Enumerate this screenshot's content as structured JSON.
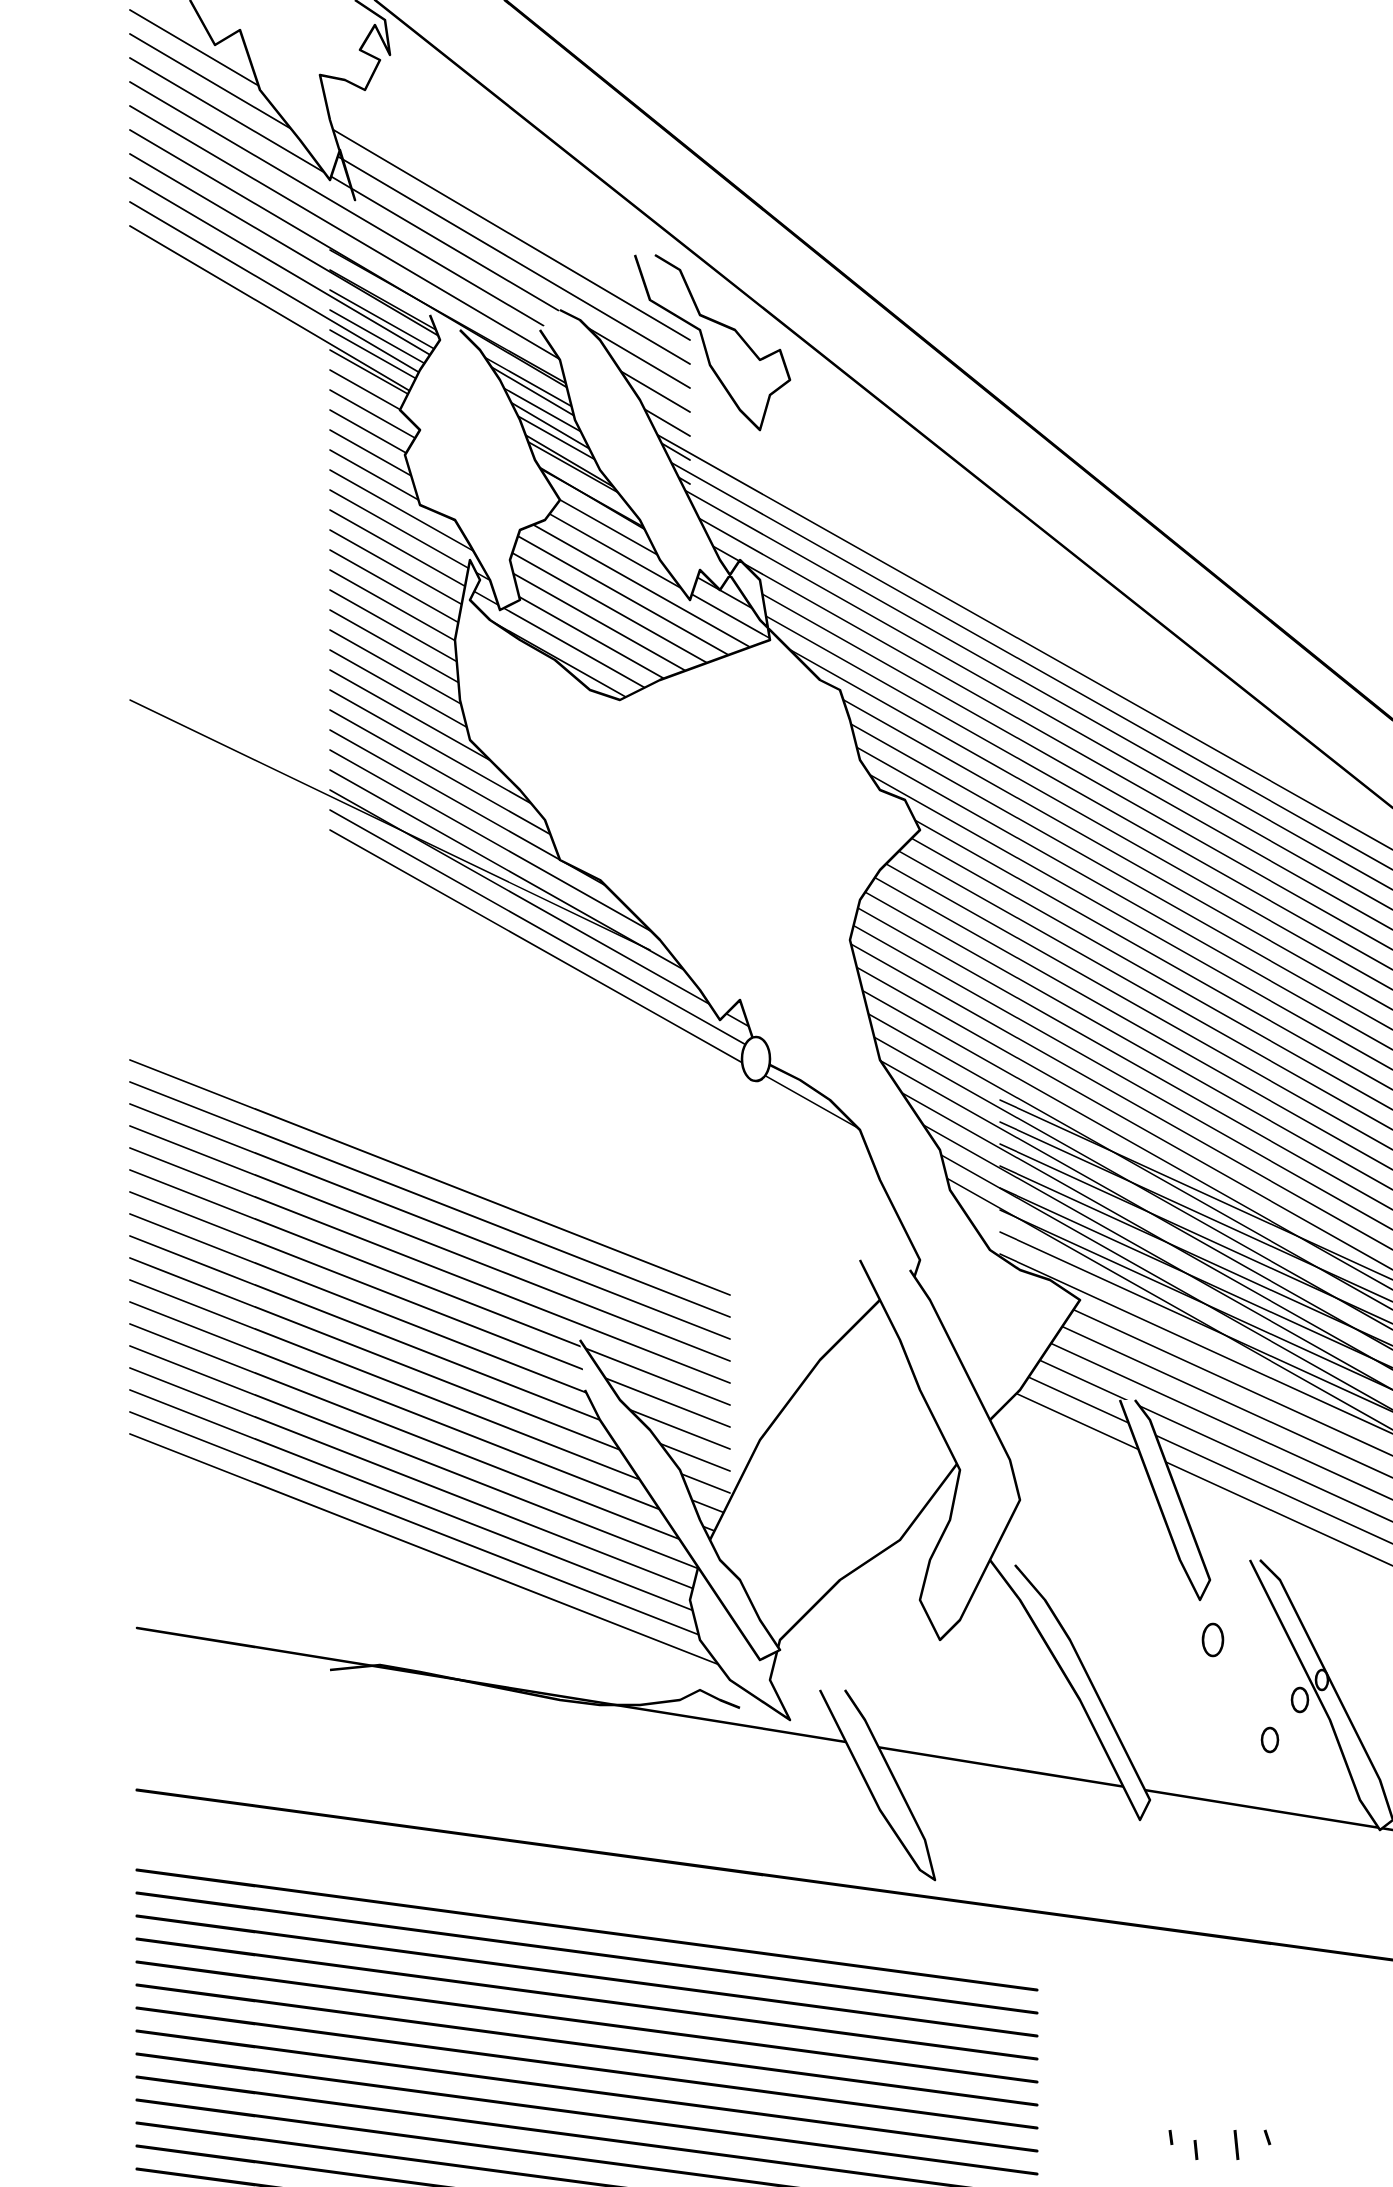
{
  "artwork": {
    "title": "",
    "width": 1393,
    "height": 2187,
    "background": "#ffffff",
    "ink": "#000000",
    "style": "black-and-white ink line drawing with diagonal speed/hatching lines and a jagged flame-like burst"
  },
  "frame_lines": [
    {
      "x1": 505,
      "y1": 0,
      "x2": 1393,
      "y2": 720,
      "w": 3
    },
    {
      "x1": 375,
      "y1": 0,
      "x2": 1393,
      "y2": 808,
      "w": 2.5
    },
    {
      "x1": 130,
      "y1": 700,
      "x2": 650,
      "y2": 950,
      "w": 1.5
    },
    {
      "x1": 137,
      "y1": 1628,
      "x2": 1393,
      "y2": 1830,
      "w": 2.5
    },
    {
      "x1": 137,
      "y1": 1790,
      "x2": 1393,
      "y2": 1960,
      "w": 3
    }
  ],
  "hatch_groups": [
    {
      "name": "top-left-band",
      "count": 10,
      "x_start": 130,
      "y_start": 10,
      "dx": 560,
      "dy": 330,
      "spacing": 24,
      "w": 1.8,
      "clip_x": [
        130,
        690
      ]
    },
    {
      "name": "upper-right-band",
      "count": 30,
      "x_start": 330,
      "y_start": 250,
      "dx": 1063,
      "dy": 600,
      "spacing": 20,
      "w": 1.6,
      "clip_x": [
        330,
        1393
      ]
    },
    {
      "name": "middle-left-band",
      "count": 18,
      "x_start": 130,
      "y_start": 1060,
      "dx": 600,
      "dy": 235,
      "spacing": 22,
      "w": 1.8,
      "clip_x": [
        130,
        730
      ]
    },
    {
      "name": "right-lower-band",
      "count": 14,
      "x_start": 1000,
      "y_start": 1100,
      "dx": 393,
      "dy": 180,
      "spacing": 22,
      "w": 1.6,
      "clip_x": [
        1000,
        1393
      ]
    },
    {
      "name": "bottom-band",
      "count": 14,
      "x_start": 137,
      "y_start": 1870,
      "dx": 900,
      "dy": 120,
      "spacing": 23,
      "w": 3,
      "clip_x": [
        137,
        1040
      ]
    }
  ],
  "flame_shapes": [
    {
      "name": "top-flame-1",
      "points": "190,0 215,45 240,30 260,90 300,140 330,180 340,150 355,200 330,120 320,75 345,80 365,90 380,60 360,50 375,25 390,55 385,20 355,0"
    },
    {
      "name": "top-flame-2",
      "points": "635,255 650,300 700,330 710,365 740,410 760,430 770,395 790,380 780,350 760,360 735,330 700,315 680,270 655,255"
    },
    {
      "name": "left-flame-main",
      "points": "430,315 440,340 420,370 400,410 420,430 405,455 420,505 455,520 470,545 490,580 500,610 520,600 510,560 520,530 545,520 560,500 535,460 520,420 500,380 480,350 460,330"
    },
    {
      "name": "center-burst",
      "points": "540,330 560,360 575,420 600,470 640,520 660,560 690,600 700,570 720,590 740,560 760,580 770,640 660,680 620,700 590,690 555,660 520,640 490,620 470,600 480,580 470,560 455,640 460,700 470,740 500,770 520,790 545,820 560,860 600,880 620,900 660,940 700,990 720,1020 740,1000 760,1060 800,1080 830,1100 860,1130 880,1180 900,1220 920,1260 910,1290 880,1300 850,1330 820,1360 790,1400 760,1440 740,1480 720,1520 700,1560 690,1600 700,1640 730,1680 760,1700 790,1720 770,1680 780,1640 810,1610 840,1580 870,1560 900,1540 930,1500 960,1460 990,1420 1020,1390 1040,1360 1060,1330 1080,1300 1050,1280 1020,1270 990,1250 970,1220 950,1190 940,1150 920,1120 900,1090 880,1060 870,1020 860,980 850,940 860,900 880,870 900,850 920,830 905,800 880,790 860,760 850,720 840,690 820,680 800,660 780,640 760,620 740,590 720,560 700,520 680,480 660,440 640,400 620,370 600,340 580,320 560,310"
    },
    {
      "name": "lower-left-flame",
      "points": "580,1340 600,1370 620,1400 650,1430 680,1470 700,1520 720,1560 740,1580 760,1620 780,1650 760,1660 740,1630 720,1600 700,1570 680,1540 660,1510 640,1480 620,1450 600,1420 585,1390"
    },
    {
      "name": "lower-center-flame",
      "points": "860,1260 880,1300 900,1340 920,1390 940,1430 960,1470 950,1520 930,1560 920,1600 940,1640 960,1620 980,1580 1000,1540 1020,1500 1010,1460 990,1420 970,1380 950,1340 930,1300 910,1270"
    },
    {
      "name": "bottom-drip-1",
      "points": "820,1690 840,1730 860,1770 880,1810 900,1840 920,1870 935,1880 925,1840 905,1800 885,1760 865,1720 845,1690"
    },
    {
      "name": "bottom-drip-2",
      "points": "990,1560 1020,1600 1050,1650 1080,1700 1100,1740 1120,1780 1140,1820 1150,1800 1130,1760 1110,1720 1090,1680 1070,1640 1045,1600 1015,1565"
    },
    {
      "name": "right-flame-1",
      "points": "1120,1400 1135,1440 1150,1480 1165,1520 1180,1560 1200,1600 1210,1580 1195,1540 1180,1500 1165,1460 1150,1420 1135,1400"
    },
    {
      "name": "right-flame-2",
      "points": "1250,1560 1270,1600 1290,1640 1310,1680 1330,1720 1345,1760 1360,1800 1380,1830 1393,1820 1380,1780 1360,1740 1340,1700 1320,1660 1300,1620 1280,1580 1260,1560"
    },
    {
      "name": "ground-crack",
      "points": "330,1670 380,1665 420,1672 460,1680 510,1690 560,1700 600,1705 640,1705 680,1700 700,1690 720,1700 740,1708"
    }
  ],
  "small_blobs": [
    {
      "name": "blob-1",
      "cx": 756,
      "cy": 1059,
      "rx": 14,
      "ry": 22
    },
    {
      "name": "blob-2",
      "cx": 1213,
      "cy": 1640,
      "rx": 10,
      "ry": 16
    },
    {
      "name": "blob-3",
      "cx": 1300,
      "cy": 1700,
      "rx": 8,
      "ry": 12
    },
    {
      "name": "blob-4",
      "cx": 1322,
      "cy": 1680,
      "rx": 6,
      "ry": 10
    },
    {
      "name": "blob-5",
      "cx": 1270,
      "cy": 1740,
      "rx": 8,
      "ry": 12
    }
  ],
  "debris_marks": [
    {
      "x1": 1170,
      "y1": 2130,
      "x2": 1172,
      "y2": 2145
    },
    {
      "x1": 1195,
      "y1": 2140,
      "x2": 1197,
      "y2": 2160
    },
    {
      "x1": 1235,
      "y1": 2130,
      "x2": 1238,
      "y2": 2160
    },
    {
      "x1": 1265,
      "y1": 2130,
      "x2": 1270,
      "y2": 2145
    }
  ]
}
